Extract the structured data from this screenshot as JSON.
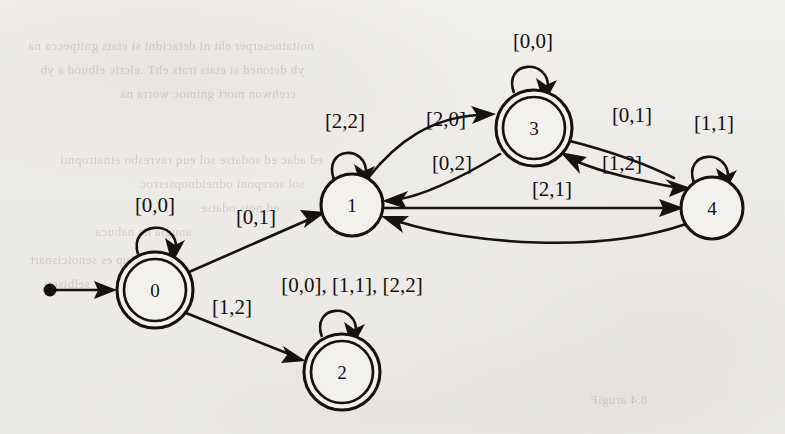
{
  "page": {
    "background_color": "#efedea",
    "ink_color": "#16130f",
    "kind": "scanned-textbook-figure"
  },
  "bleed_through_text": [
    {
      "text": "noitatneserper eht ni detacidni si etats gnitpecca na",
      "x": 28,
      "y": 38
    },
    {
      "text": "yb detoned si etats trats ehT .elcric elbuod a yb",
      "x": 40,
      "y": 62
    },
    {
      "text": "erehwon morf gnimoc worra na",
      "x": 120,
      "y": 86
    },
    {
      "text": "ed adac ed sodatse sol euq ravresbo etnatropmi",
      "x": 60,
      "y": 152
    },
    {
      "text": "sol soreponi odneidnopserroc",
      "x": 140,
      "y": 176
    },
    {
      "text": "ed nois odatse",
      "x": 200,
      "y": 200
    },
    {
      "text": "anugla ne nabuca",
      "x": 95,
      "y": 224
    },
    {
      "text": "otse nedeup es senoicisnart",
      "x": 30,
      "y": 252
    },
    {
      "text": "selbisop",
      "x": 44,
      "y": 276
    },
    {
      "text": "8.4 arugiF",
      "x": 590,
      "y": 392
    }
  ],
  "diagram": {
    "type": "finite-state-automaton",
    "states": [
      {
        "id": "0",
        "label": "0",
        "cx": 155,
        "cy": 290,
        "r": 38,
        "accepting": true,
        "start": true
      },
      {
        "id": "1",
        "label": "1",
        "cx": 352,
        "cy": 205,
        "r": 31,
        "accepting": false,
        "start": false
      },
      {
        "id": "2",
        "label": "2",
        "cx": 342,
        "cy": 372,
        "r": 38,
        "accepting": true,
        "start": false
      },
      {
        "id": "3",
        "label": "3",
        "cx": 534,
        "cy": 128,
        "r": 38,
        "accepting": true,
        "start": false
      },
      {
        "id": "4",
        "label": "4",
        "cx": 712,
        "cy": 208,
        "r": 31,
        "accepting": false,
        "start": false
      }
    ],
    "start_marker": {
      "dot_x": 50,
      "dot_y": 290,
      "arrow_tip_x": 117,
      "arrow_tip_y": 290
    },
    "self_loops": [
      {
        "state": "0",
        "label": "[0,0]",
        "label_x": 155,
        "label_y": 212
      },
      {
        "state": "1",
        "label": "[2,2]",
        "label_x": 345,
        "label_y": 128
      },
      {
        "state": "2",
        "label": "[0,0], [1,1], [2,2]",
        "label_x": 352,
        "label_y": 292
      },
      {
        "state": "3",
        "label": "[0,0]",
        "label_x": 533,
        "label_y": 48
      },
      {
        "state": "4",
        "label": "[1,1]",
        "label_x": 714,
        "label_y": 130
      }
    ],
    "transitions": [
      {
        "from": "0",
        "to": "0",
        "label": "[0,0]"
      },
      {
        "from": "0",
        "to": "1",
        "label": "[0,1]",
        "label_x": 256,
        "label_y": 224
      },
      {
        "from": "0",
        "to": "2",
        "label": "[1,2]",
        "label_x": 232,
        "label_y": 314
      },
      {
        "from": "1",
        "to": "1",
        "label": "[2,2]"
      },
      {
        "from": "1",
        "to": "3",
        "label": "[2,0]",
        "label_x": 446,
        "label_y": 126
      },
      {
        "from": "1",
        "to": "4",
        "label": "[2,1]",
        "label_x": 552,
        "label_y": 196
      },
      {
        "from": "2",
        "to": "2",
        "label": "[0,0], [1,1], [2,2]"
      },
      {
        "from": "3",
        "to": "3",
        "label": "[0,0]"
      },
      {
        "from": "3",
        "to": "1",
        "label": "[0,2]",
        "label_x": 452,
        "label_y": 170
      },
      {
        "from": "3",
        "to": "4",
        "label": "[0,1]",
        "label_x": 632,
        "label_y": 122
      },
      {
        "from": "4",
        "to": "4",
        "label": "[1,1]"
      },
      {
        "from": "4",
        "to": "3",
        "label": "[1,0]",
        "label_x": 622,
        "label_y": 170
      },
      {
        "from": "4",
        "to": "1",
        "label": "[1,2]",
        "label_x": 552,
        "label_y": 228
      }
    ]
  }
}
